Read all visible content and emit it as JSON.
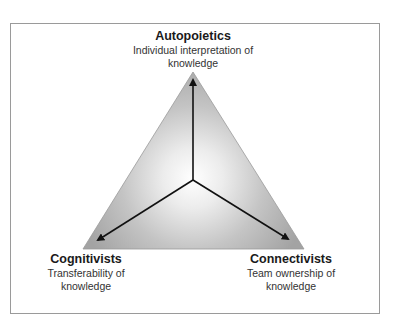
{
  "diagram": {
    "type": "triangle-vertex-diagram",
    "vertices": [
      {
        "id": "top",
        "title": "Autopoietics",
        "desc_line1": "Individual interpretation of",
        "desc_line2": "knowledge"
      },
      {
        "id": "bottom-left",
        "title": "Cognitivists",
        "desc_line1": "Transferability of",
        "desc_line2": "knowledge"
      },
      {
        "id": "bottom-right",
        "title": "Connectivists",
        "desc_line1": "Team ownership of",
        "desc_line2": "knowledge"
      }
    ],
    "arrows": [
      {
        "from": "center",
        "to": "top"
      },
      {
        "from": "center",
        "to": "bottom-left"
      },
      {
        "from": "center",
        "to": "bottom-right"
      }
    ],
    "colors": {
      "frame_border": "#9a9a9a",
      "triangle_center": "#ffffff",
      "triangle_edge": "#9e9e9e",
      "arrow": "#111111"
    }
  }
}
